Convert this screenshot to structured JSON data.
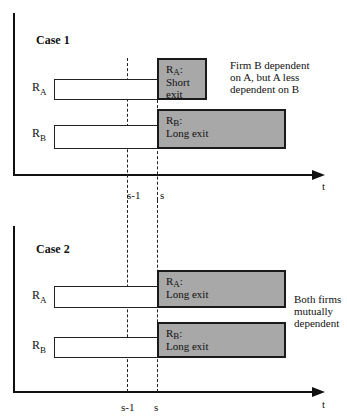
{
  "case1": {
    "title": "Case 1",
    "rows": [
      {
        "r": "R",
        "sub": "A",
        "box_sub": "A",
        "box_r": "R",
        "box_line1": "Short",
        "box_line2": "exit"
      },
      {
        "r": "R",
        "sub": "B",
        "box_sub": "B",
        "box_r": "R",
        "box_line1": "Long exit",
        "box_line2": ""
      }
    ],
    "note": [
      "Firm B dependent",
      "on A, but A less",
      "dependent on B"
    ],
    "ticks": {
      "s_minus_1": "s-1",
      "s": "s"
    },
    "axis_label": "t"
  },
  "case2": {
    "title": "Case 2",
    "rows": [
      {
        "r": "R",
        "sub": "A",
        "box_sub": "A",
        "box_r": "R",
        "box_line1": "Long exit"
      },
      {
        "r": "R",
        "sub": "B",
        "box_sub": "B",
        "box_r": "R",
        "box_line1": "Long exit"
      }
    ],
    "note": [
      "Both firms",
      "mutually",
      "dependent"
    ],
    "ticks": {
      "s_minus_1": "s-1",
      "s": "s"
    },
    "axis_label": "t"
  },
  "colors": {
    "box_fill": "#a8a8a8",
    "line": "#111111"
  },
  "colon": ":"
}
